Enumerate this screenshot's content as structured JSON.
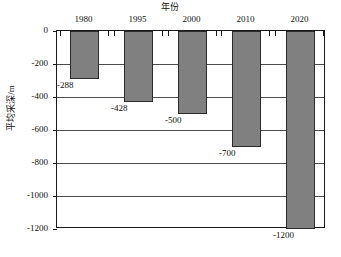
{
  "chart_data": {
    "type": "bar",
    "title": "年份",
    "xlabel": "",
    "ylabel": "平均采深/m",
    "categories": [
      "1980",
      "1995",
      "2000",
      "2010",
      "2020"
    ],
    "values": [
      -288,
      -428,
      -500,
      -700,
      -1200
    ],
    "value_labels": [
      "-288",
      "-428",
      "-500",
      "-700",
      "-1200"
    ],
    "ylim": [
      -1200,
      0
    ],
    "yticks": [
      0,
      -200,
      -400,
      -600,
      -800,
      -1000,
      -1200
    ],
    "ytick_labels": [
      "0",
      "-200",
      "-400",
      "-600",
      "-800",
      "-1000",
      "-1200"
    ],
    "grid": true,
    "legend": "none",
    "bar_color": "#808080",
    "bar_border_color": "#2b2b2b",
    "axis_color": "#1a1a1a",
    "grid_color": "#4d4d4d",
    "background": "#ffffff",
    "category_labels_position": "top",
    "value_labels_position": "below-bar-end"
  }
}
